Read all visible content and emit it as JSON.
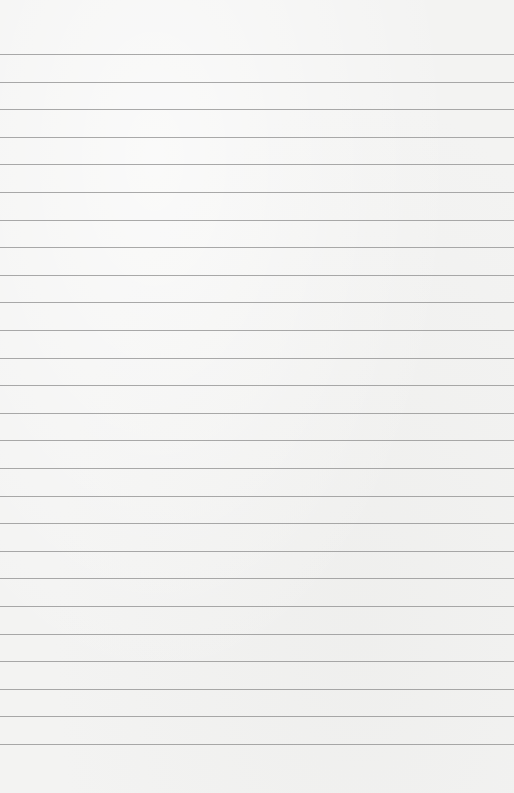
{
  "paper": {
    "type": "lined-paper",
    "background_color": "#f3f3f2",
    "line_color": "#8e8e8e",
    "first_line_y": 54,
    "line_spacing": 27.6,
    "line_count": 26
  }
}
